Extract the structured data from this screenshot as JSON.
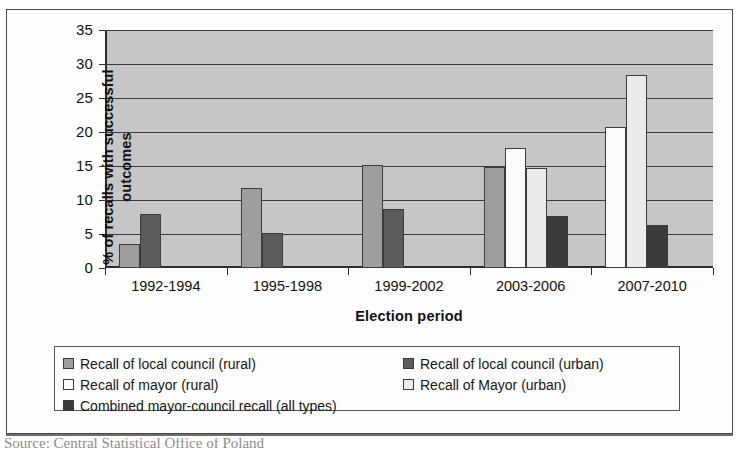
{
  "figure": {
    "source_note": "Source: Central Statistical Office of Poland"
  },
  "legend": {
    "items": [
      {
        "label": "Recall of local council (rural)",
        "swatch": "#9d9d9d"
      },
      {
        "label": "Recall of local council (urban)",
        "swatch": "#5c5c5c"
      },
      {
        "label": "Recall of mayor (rural)",
        "swatch": "#fbfbfb"
      },
      {
        "label": "Recall of Mayor (urban)",
        "swatch": "#ebebeb"
      },
      {
        "label": "Combined mayor-council recall (all types)",
        "swatch": "#3a3a3a"
      }
    ]
  },
  "chart_data": {
    "type": "bar",
    "title": "",
    "xlabel": "Election period",
    "ylabel": "% of recalls with successful outcomes",
    "categories": [
      "1992-1994",
      "1995-1998",
      "1999-2002",
      "2003-2006",
      "2007-2010"
    ],
    "ylim": [
      0,
      35
    ],
    "yticks": [
      0,
      5,
      10,
      15,
      20,
      25,
      30,
      35
    ],
    "grid": true,
    "legend_position": "below",
    "series": [
      {
        "name": "Recall of local council (rural)",
        "color": "#9d9d9d",
        "values": [
          3.6,
          11.7,
          15.2,
          14.8,
          null
        ]
      },
      {
        "name": "Recall of local council (urban)",
        "color": "#5c5c5c",
        "values": [
          7.9,
          5.1,
          8.7,
          null,
          null
        ]
      },
      {
        "name": "Recall of mayor (rural)",
        "color": "#fbfbfb",
        "values": [
          null,
          null,
          null,
          17.6,
          20.8
        ]
      },
      {
        "name": "Recall of Mayor (urban)",
        "color": "#ebebeb",
        "values": [
          null,
          null,
          null,
          14.7,
          28.4
        ]
      },
      {
        "name": "Combined mayor-council recall (all types)",
        "color": "#3a3a3a",
        "values": [
          null,
          null,
          null,
          7.6,
          6.3
        ]
      }
    ]
  }
}
